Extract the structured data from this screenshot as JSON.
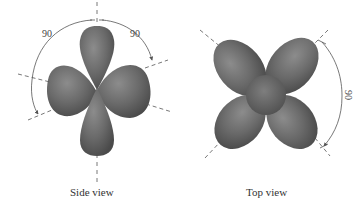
{
  "figure": {
    "panels": [
      {
        "id": "side",
        "caption": "Side view",
        "angles": [
          {
            "label": "90",
            "position": "upper-left"
          },
          {
            "label": "90",
            "position": "upper-right"
          }
        ]
      },
      {
        "id": "top",
        "caption": "Top view",
        "angles": [
          {
            "label": "90",
            "position": "right"
          }
        ]
      }
    ],
    "colors": {
      "lobe_dark": "#4a4a4a",
      "lobe_mid": "#6e6e6e",
      "lobe_light": "#8c8c8c",
      "line": "#555555",
      "background": "#ffffff"
    }
  }
}
